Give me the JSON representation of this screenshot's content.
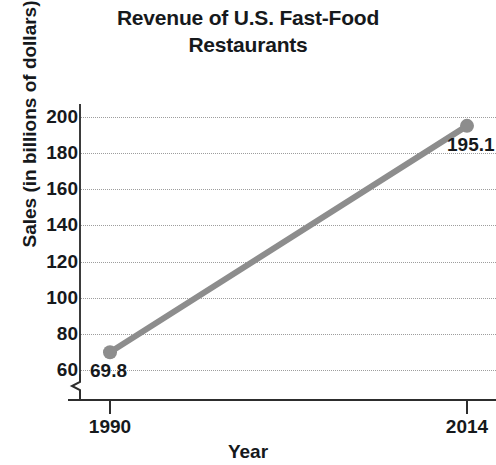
{
  "chart_data": {
    "type": "line",
    "title": "Revenue of U.S. Fast-Food Restaurants",
    "title_lines": [
      "Revenue of U.S. Fast-Food",
      "Restaurants"
    ],
    "xlabel": "Year",
    "ylabel": "Sales (in billions of dollars)",
    "x": [
      1990,
      2014
    ],
    "values": [
      69.8,
      195.1
    ],
    "categories": [
      "1990",
      "2014"
    ],
    "point_labels": [
      "69.8",
      "195.1"
    ],
    "xticks": [
      "1990",
      "2014"
    ],
    "yticks": [
      "60",
      "80",
      "100",
      "120",
      "140",
      "160",
      "180",
      "200"
    ],
    "ytick_values": [
      60,
      80,
      100,
      120,
      140,
      160,
      180,
      200
    ],
    "ylim": [
      60,
      200
    ],
    "xlim": [
      1990,
      2014
    ],
    "grid": "horizontal-dotted",
    "legend": "none",
    "y_axis_break": true,
    "series_color": "#8d8d8d",
    "text_color": "#16191c",
    "grid_color": "#9d9d9d",
    "axis_color": "#2d2d2d"
  }
}
